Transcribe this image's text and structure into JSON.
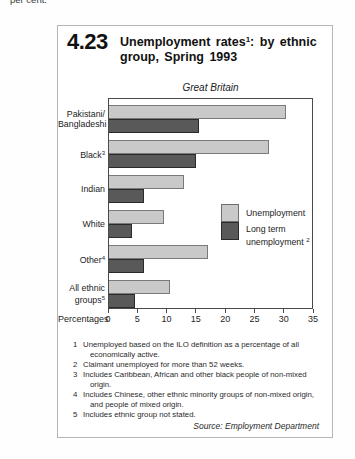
{
  "page": {
    "top_text": "per cent."
  },
  "figure": {
    "number": "4.23",
    "title": {
      "pre": "Unemployment rates",
      "sup": "1",
      "post": ": by ethnic group, Spring 1993"
    },
    "region": "Great Britain",
    "source": "Source: Employment Department"
  },
  "chart_data": {
    "type": "bar",
    "orientation": "horizontal",
    "region": "Great Britain",
    "xlabel": "Percentages",
    "xlim": [
      0,
      35
    ],
    "xticks": [
      "0",
      "5",
      "10",
      "15",
      "20",
      "25",
      "30",
      "35"
    ],
    "grid": false,
    "legend_position": "inside-right",
    "categories": [
      {
        "lines": [
          "Pakistani/",
          "Bangladeshi"
        ],
        "sup": ""
      },
      {
        "lines": [
          "Black"
        ],
        "sup": "3"
      },
      {
        "lines": [
          "Indian"
        ],
        "sup": ""
      },
      {
        "lines": [
          "White"
        ],
        "sup": ""
      },
      {
        "lines": [
          "Other"
        ],
        "sup": "4"
      },
      {
        "lines": [
          "All ethnic groups"
        ],
        "sup": "5"
      }
    ],
    "series": [
      {
        "name": "Unemployment",
        "color": "#c9c9c9",
        "values": [
          30.5,
          27.5,
          13,
          9.5,
          17,
          10.5
        ]
      },
      {
        "name": "Long term unemployment",
        "name_sup": "2",
        "color": "#595959",
        "values": [
          15.5,
          15,
          6,
          4,
          6,
          4.5
        ]
      }
    ]
  },
  "legend": {
    "item1": "Unemployment",
    "item2_line1": "Long term",
    "item2_line2": "unemployment ",
    "item2_sup": "2"
  },
  "axis": {
    "label": "Percentages"
  },
  "footnotes": [
    {
      "num": "1",
      "text": "Unemployed based on the ILO definition as a percentage of all economically active."
    },
    {
      "num": "2",
      "text": "Claimant unemployed for more than 52 weeks."
    },
    {
      "num": "3",
      "text": "Includes Caribbean, African and other black people of non-mixed origin."
    },
    {
      "num": "4",
      "text": "Includes Chinese, other ethnic minority groups of non-mixed origin, and people of mixed origin."
    },
    {
      "num": "5",
      "text": "Includes ethnic group not stated."
    }
  ]
}
